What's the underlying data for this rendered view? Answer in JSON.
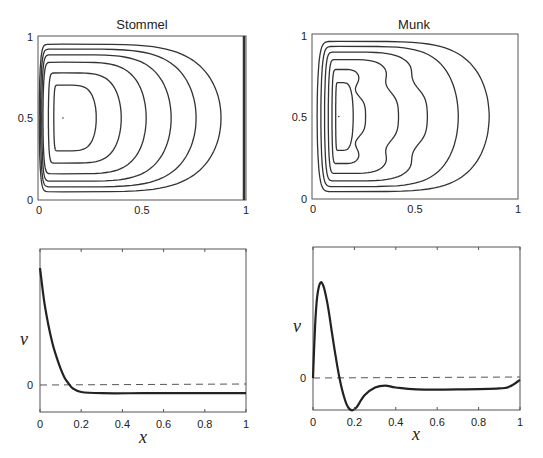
{
  "chart_data": [
    {
      "type": "contour",
      "title": "Stommel",
      "xlabel": "",
      "ylabel": "",
      "xlim": [
        0,
        1
      ],
      "ylim": [
        0,
        1
      ],
      "xticks": [
        "0",
        "0.5",
        "1"
      ],
      "yticks": [
        "0",
        "0.5",
        "1"
      ],
      "center": [
        0.12,
        0.5
      ],
      "contour_levels": 7,
      "contour_right_extents": [
        0.88,
        0.76,
        0.64,
        0.52,
        0.4,
        0.28
      ],
      "description": "Streamfunction contours with western boundary intensification"
    },
    {
      "type": "contour",
      "title": "Munk",
      "xlabel": "",
      "ylabel": "",
      "xlim": [
        0,
        1
      ],
      "ylim": [
        0,
        1
      ],
      "xticks": [
        "0",
        "0.5",
        "1"
      ],
      "yticks": [
        "0",
        "0.5",
        "1"
      ],
      "center": [
        0.13,
        0.5
      ],
      "contour_levels": 7,
      "contour_right_extents": [
        0.86,
        0.71,
        0.56,
        0.42,
        0.26,
        0.2
      ],
      "description": "Streamfunction contours with western boundary intensification and recirculation"
    },
    {
      "type": "line",
      "title": "",
      "xlabel": "x",
      "ylabel": "v",
      "xlim": [
        0,
        1
      ],
      "xticks": [
        "0",
        "0.2",
        "0.4",
        "0.6",
        "0.8",
        "1"
      ],
      "yticks": [
        "0"
      ],
      "zero_line": "dashed",
      "series": [
        {
          "name": "Stommel v",
          "x": [
            0,
            0.02,
            0.04,
            0.06,
            0.08,
            0.1,
            0.12,
            0.14,
            0.16,
            0.2,
            0.3,
            0.5,
            0.7,
            1.0
          ],
          "y": [
            1.0,
            0.72,
            0.52,
            0.36,
            0.24,
            0.14,
            0.06,
            0.01,
            -0.03,
            -0.06,
            -0.07,
            -0.07,
            -0.07,
            -0.07
          ]
        }
      ]
    },
    {
      "type": "line",
      "title": "",
      "xlabel": "x",
      "ylabel": "v",
      "xlim": [
        0,
        1
      ],
      "xticks": [
        "0",
        "0.2",
        "0.4",
        "0.6",
        "0.8",
        "1"
      ],
      "yticks": [
        "0"
      ],
      "zero_line": "dashed",
      "series": [
        {
          "name": "Munk v",
          "x": [
            0,
            0.01,
            0.02,
            0.035,
            0.05,
            0.07,
            0.09,
            0.11,
            0.13,
            0.15,
            0.17,
            0.19,
            0.21,
            0.25,
            0.3,
            0.35,
            0.4,
            0.5,
            0.7,
            0.9,
            0.95,
            1.0
          ],
          "y": [
            0,
            0.55,
            0.85,
            1.0,
            0.97,
            0.78,
            0.5,
            0.22,
            -0.02,
            -0.2,
            -0.31,
            -0.34,
            -0.31,
            -0.18,
            -0.1,
            -0.08,
            -0.1,
            -0.12,
            -0.12,
            -0.11,
            -0.09,
            -0.02
          ]
        }
      ]
    }
  ],
  "panels": {
    "stommel_title": "Stommel",
    "munk_title": "Munk",
    "ylabel_v": "v",
    "xlabel_x": "x"
  }
}
